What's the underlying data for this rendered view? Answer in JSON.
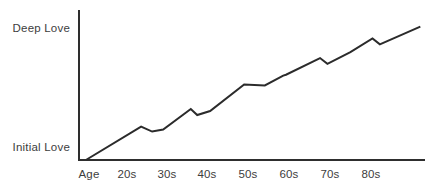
{
  "chart_data": {
    "type": "line",
    "title": "",
    "subtitle": "",
    "xlabel": "Age",
    "ylabel": "",
    "grid": false,
    "legend": false,
    "legend_position": "none",
    "y_axis_labels": [
      {
        "label": "Deep Love",
        "value": 100
      },
      {
        "label": "Initial Love",
        "value": 0
      }
    ],
    "ylim": [
      0,
      100
    ],
    "xlim": [
      15,
      90
    ],
    "x_tick_labels": [
      "Age",
      "20s",
      "30s",
      "40s",
      "50s",
      "60s",
      "70s",
      "80s"
    ],
    "x_tick_values": [
      15,
      22,
      30,
      38,
      46,
      54,
      62,
      70
    ],
    "series": [
      {
        "name": "Love over a lifetime",
        "x": [
          16.5,
          28.5,
          30.9,
          33.3,
          39.3,
          40.7,
          43.5,
          50.9,
          55.4,
          59.4,
          60.0,
          67.4,
          69.0,
          74.0,
          78.8,
          80.4,
          89.2
        ],
        "y": [
          0,
          22.4,
          19.1,
          20.4,
          34.2,
          30.2,
          32.9,
          50.7,
          50.0,
          56.6,
          57.2,
          68.4,
          64.5,
          72.4,
          81.6,
          77.6,
          89.5
        ]
      }
    ],
    "annotations": []
  },
  "colors": {
    "background": "#ffffff",
    "line": "#2b2b2b",
    "axis": "#2e2e2e",
    "text": "#3d3d3d"
  },
  "geometry": {
    "plot_left": 79,
    "plot_right": 424,
    "plot_top": 11,
    "plot_bottom": 160,
    "deep_love_label_y": 29,
    "initial_love_label_y": 148,
    "tick_label_y": 170,
    "label_right_x": 70,
    "tick_x_positions": [
      89,
      127,
      167,
      207,
      248,
      289,
      330,
      371
    ],
    "points_px": [
      [
        84,
        160
      ],
      [
        138,
        127
      ],
      [
        149,
        132
      ],
      [
        160,
        130
      ],
      [
        180,
        109
      ],
      [
        187,
        115
      ],
      [
        200,
        111
      ],
      [
        228,
        85
      ],
      [
        248,
        85
      ],
      [
        268,
        75
      ],
      [
        271,
        74
      ],
      [
        285,
        58
      ],
      [
        292,
        64
      ],
      [
        315,
        52
      ],
      [
        337,
        39
      ],
      [
        346,
        45
      ],
      [
        411,
        27
      ]
    ]
  }
}
